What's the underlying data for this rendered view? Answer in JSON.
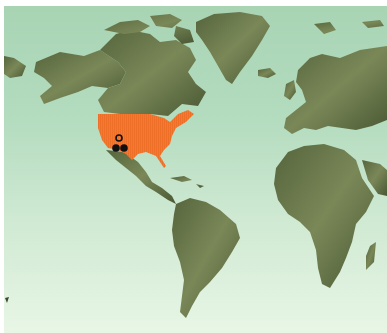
{
  "map": {
    "type": "world-physical-relief",
    "projection": "world",
    "colors": {
      "ocean_top": "#a8d4b4",
      "ocean_bottom": "#e8f6e6",
      "land": "#6b7a4e",
      "land_dark": "#3f4a2c",
      "highlight": "#f47a30",
      "marker": "#111111"
    },
    "highlighted_region": {
      "name": "United States",
      "color": "#f47a30"
    },
    "markers": [
      {
        "kind": "open-circle",
        "x": 119,
        "y": 138
      },
      {
        "kind": "filled-circle",
        "x": 116,
        "y": 148
      },
      {
        "kind": "filled-circle",
        "x": 124,
        "y": 148
      }
    ]
  }
}
